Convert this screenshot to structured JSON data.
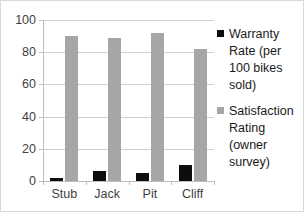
{
  "chart_data": {
    "type": "bar",
    "title": "",
    "xlabel": "",
    "ylabel": "",
    "ylim": [
      0,
      100
    ],
    "ytick_labels": [
      "100",
      "80",
      "60",
      "40",
      "20",
      "0"
    ],
    "ytick_values": [
      100,
      80,
      60,
      40,
      20,
      0
    ],
    "grid": true,
    "legend_position": "right",
    "categories": [
      "Stub",
      "Jack",
      "Pit",
      "Cliff"
    ],
    "series": [
      {
        "name": "Warranty Rate (per 100 bikes sold)",
        "color": "#0d0d0d",
        "values": [
          2,
          6,
          5,
          10
        ]
      },
      {
        "name": "Satisfaction Rating (owner survey)",
        "color": "#a6a6a6",
        "values": [
          90,
          89,
          92,
          82
        ]
      }
    ]
  },
  "legend": {
    "entries": [
      {
        "label": "Warranty Rate (per 100 bikes sold)",
        "swatch": "black-square-icon"
      },
      {
        "label": "Satisfaction Rating (owner survey)",
        "swatch": "gray-square-icon"
      }
    ]
  }
}
